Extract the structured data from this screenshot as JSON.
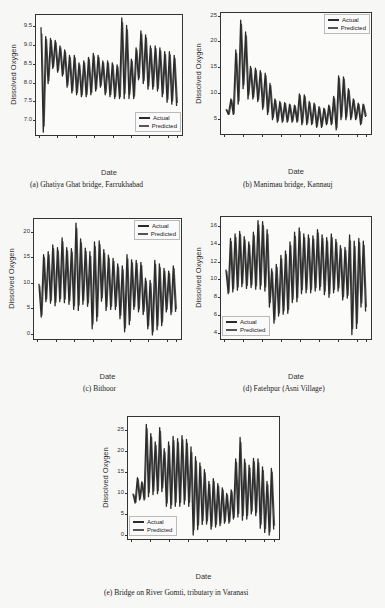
{
  "figure": {
    "captions": {
      "a": "(a)   Ghatiya Ghat bridge, Farrukhabad",
      "b": "(b) Manimau bridge, Kannauj",
      "c": "(c)   Bithoor",
      "d": "(d) Fatehpur (Asni Village)",
      "e": "(e) Bridge on River Gomti, tributary in Varanasi"
    }
  },
  "colors": {
    "actual": "#2b2b2b",
    "predicted": "#555555"
  },
  "chart_data": [
    {
      "id": "a",
      "type": "line",
      "title": "Ghatiya Ghat bridge, Farrukhabad",
      "xlabel": "Date",
      "ylabel": "Dissolved Oxygen",
      "ylim": [
        6.6,
        9.8
      ],
      "yticks": [
        "9.5",
        "9.0",
        "8.5",
        "8.0",
        "7.5",
        "7.0"
      ],
      "ytick_values": [
        9.5,
        9.0,
        8.5,
        8.0,
        7.5,
        7.0
      ],
      "xticks": [
        "2021-04-01",
        "2021-04-05",
        "2021-04-09",
        "2021-04-13",
        "2021-04-17",
        "2021-04-21",
        "2021-04-25",
        "2021-04-29",
        "2021-05-01"
      ],
      "legend": {
        "position": "lower right",
        "entries": [
          "Actual",
          "Predicted"
        ]
      },
      "grid": false,
      "series": [
        {
          "name": "Actual",
          "peaks": [
            9.5,
            9.25,
            9.2,
            9.15,
            9.0,
            8.9,
            8.75,
            8.75,
            8.55,
            8.6,
            8.7,
            8.8,
            8.75,
            8.6,
            8.6,
            8.55,
            8.5,
            9.75,
            9.55,
            8.65,
            8.95,
            9.4,
            9.3,
            9.0,
            9.0,
            8.95,
            8.85,
            8.85,
            8.75
          ],
          "troughs": [
            6.7,
            8.0,
            8.4,
            8.3,
            8.2,
            7.9,
            7.75,
            7.7,
            7.65,
            7.65,
            7.7,
            7.8,
            7.9,
            7.7,
            7.65,
            7.6,
            7.6,
            7.6,
            7.6,
            7.6,
            8.1,
            8.0,
            7.85,
            7.85,
            7.8,
            7.65,
            7.5,
            7.45,
            7.4
          ]
        },
        {
          "name": "Predicted",
          "note": "closely follows Actual"
        }
      ]
    },
    {
      "id": "b",
      "type": "line",
      "title": "Manimau bridge, Kannauj",
      "xlabel": "Date",
      "ylabel": "Dissolved Oxygen",
      "ylim": [
        2,
        25.5
      ],
      "yticks": [
        "25",
        "20",
        "15",
        "10",
        "5"
      ],
      "ytick_values": [
        25,
        20,
        15,
        10,
        5
      ],
      "xticks": [
        "2021-04-01",
        "2021-04-05",
        "2021-04-09",
        "2021-04-13",
        "2021-04-17",
        "2021-04-21",
        "2021-04-25",
        "2021-04-29",
        "2021-05-01"
      ],
      "legend": {
        "position": "upper right",
        "entries": [
          "Actual",
          "Predicted"
        ]
      },
      "grid": false,
      "series": [
        {
          "name": "Actual",
          "peaks": [
            7,
            9,
            18.5,
            24.3,
            22,
            15.3,
            15,
            14.5,
            14,
            12,
            9,
            8.5,
            8.3,
            8,
            7.8,
            10,
            9.8,
            8.5,
            8.2,
            7.5,
            7.2,
            7.8,
            9.5,
            13.5,
            13.3,
            11,
            9,
            8.2,
            8
          ],
          "troughs": [
            6,
            6,
            8,
            11,
            9,
            9,
            8.5,
            7,
            6,
            5,
            4.5,
            4.5,
            4.5,
            4.5,
            4.5,
            4,
            4,
            4,
            3.5,
            3.5,
            4,
            4,
            3,
            5,
            5,
            5,
            5,
            4,
            5.5
          ]
        },
        {
          "name": "Predicted",
          "note": "closely follows Actual"
        }
      ]
    },
    {
      "id": "c",
      "type": "line",
      "title": "Bithoor",
      "xlabel": "Date",
      "ylabel": "Dissolved Oxygen",
      "ylim": [
        -1,
        22.5
      ],
      "yticks": [
        "20",
        "15",
        "10",
        "5",
        "0"
      ],
      "ytick_values": [
        20,
        15,
        10,
        5,
        0
      ],
      "xticks": [
        "2021-04-01",
        "2021-04-05",
        "2021-04-09",
        "2021-04-13",
        "2021-04-17",
        "2021-04-21",
        "2021-04-25",
        "2021-04-29",
        "2021-05-01"
      ],
      "legend": {
        "position": "upper right",
        "entries": [
          "Actual",
          "Predicted"
        ]
      },
      "grid": false,
      "series": [
        {
          "name": "Actual",
          "peaks": [
            10,
            15.7,
            16.3,
            17.6,
            17.1,
            19,
            17.1,
            16.9,
            21.9,
            18.8,
            17,
            16.3,
            18.2,
            18.4,
            16.7,
            15.6,
            15,
            13.9,
            13.5,
            15.7,
            14.7,
            14.6,
            14.2,
            11.1,
            10.7,
            14.6,
            13.9,
            13,
            12.5,
            13.5
          ],
          "troughs": [
            3.5,
            6.5,
            6.2,
            5.7,
            6.5,
            6.3,
            6,
            5,
            4.8,
            6,
            5.6,
            1.2,
            2.7,
            6.6,
            4.8,
            5,
            5,
            3.2,
            0.6,
            2,
            5,
            4.5,
            4,
            1.2,
            0,
            1,
            1.8,
            4.5,
            4,
            4.5
          ]
        },
        {
          "name": "Predicted",
          "note": "closely follows Actual"
        }
      ]
    },
    {
      "id": "d",
      "type": "line",
      "title": "Fatehpur (Asni Village)",
      "xlabel": "Date",
      "ylabel": "Dissolved Oxygen",
      "ylim": [
        3.3,
        17
      ],
      "yticks": [
        "16",
        "14",
        "12",
        "10",
        "8",
        "6",
        "4"
      ],
      "ytick_values": [
        16,
        14,
        12,
        10,
        8,
        6,
        4
      ],
      "xticks": [
        "2021-04-01",
        "2021-04-05",
        "2021-04-09",
        "2021-04-13",
        "2021-04-17",
        "2021-04-21",
        "2021-04-25",
        "2021-04-29",
        "2021-05-01"
      ],
      "legend": {
        "position": "lower left",
        "entries": [
          "Actual",
          "Predicted"
        ]
      },
      "grid": false,
      "series": [
        {
          "name": "Actual",
          "peaks": [
            11.2,
            14.7,
            15.2,
            15.5,
            14.9,
            14.3,
            15.4,
            16.7,
            16.6,
            15.7,
            11.3,
            11.8,
            12.8,
            13.3,
            14.3,
            15.4,
            15.9,
            15.2,
            15.1,
            15,
            15.7,
            15.1,
            14.8,
            15.2,
            14.6,
            13.9,
            13.7,
            15.1,
            14.4,
            14.7,
            14.4
          ],
          "troughs": [
            8.5,
            8.7,
            8.9,
            9.3,
            9.1,
            9.2,
            9,
            9,
            8.8,
            7,
            5.2,
            6,
            6.2,
            6.3,
            7.5,
            7.6,
            8.5,
            8.6,
            8.6,
            8.8,
            8.9,
            8.4,
            8.1,
            8.6,
            8.8,
            7.8,
            8,
            3.9,
            4.6,
            7,
            6.5,
            8.6
          ]
        },
        {
          "name": "Predicted",
          "note": "closely follows Actual"
        }
      ]
    },
    {
      "id": "e",
      "type": "line",
      "title": "Bridge on River Gomti, tributary in Varanasi",
      "xlabel": "Date",
      "ylabel": "Dissolved Oxygen",
      "ylim": [
        -1,
        28
      ],
      "yticks": [
        "25",
        "20",
        "15",
        "10",
        "5",
        "0"
      ],
      "ytick_values": [
        25,
        20,
        15,
        10,
        5,
        0
      ],
      "xticks": [
        "2021-04-01",
        "2021-04-05",
        "2021-04-09",
        "2021-04-13",
        "2021-04-17",
        "2021-04-21",
        "2021-04-25",
        "2021-04-29",
        "2021-05-01"
      ],
      "legend": {
        "position": "lower left",
        "entries": [
          "Actual",
          "Predicted"
        ]
      },
      "grid": false,
      "series": [
        {
          "name": "Actual",
          "peaks": [
            10,
            13.8,
            12.8,
            26.5,
            24.3,
            22.3,
            25.7,
            20.7,
            22.3,
            23.6,
            23.1,
            23.8,
            22.9,
            21.1,
            18.8,
            17.3,
            15.7,
            12.9,
            13.6,
            12.4,
            11.4,
            10.1,
            10.9,
            18.3,
            23.4,
            18.2,
            16.8,
            18.4,
            18.3,
            16.4,
            12.9,
            16
          ],
          "troughs": [
            7.8,
            8.5,
            8.5,
            9.3,
            9.8,
            10,
            10.5,
            7,
            6.5,
            7,
            7,
            7.5,
            7,
            0.2,
            1.5,
            2.7,
            2.8,
            1.6,
            2.1,
            2.4,
            3,
            3,
            4,
            4.5,
            3.7,
            4,
            5.2,
            4.8,
            1.8,
            0.8,
            0.2,
            1.5
          ]
        },
        {
          "name": "Predicted",
          "note": "closely follows Actual"
        }
      ]
    }
  ]
}
